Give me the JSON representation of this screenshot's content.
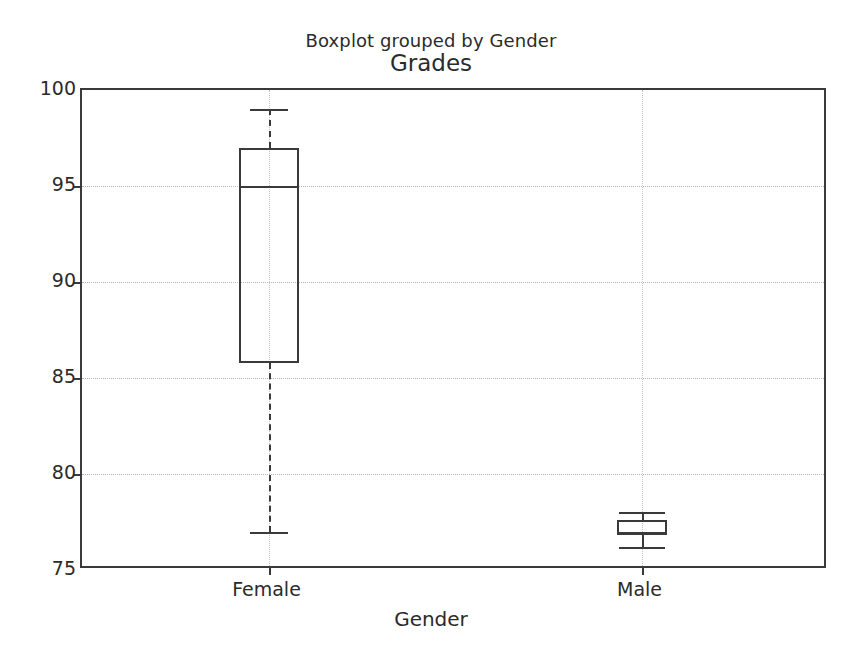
{
  "figure": {
    "suptitle": "Boxplot grouped by Gender",
    "axes_title": "Grades",
    "xlabel": "Gender",
    "ylabel": ""
  },
  "chart_data": {
    "type": "box",
    "title": "Grades",
    "suptitle": "Boxplot grouped by Gender",
    "xlabel": "Gender",
    "ylabel": "",
    "categories": [
      "Female",
      "Male"
    ],
    "xtick_labels": [
      "Female",
      "Male"
    ],
    "ytick_labels": [
      "75",
      "80",
      "85",
      "90",
      "95",
      "100"
    ],
    "yticks": [
      75,
      80,
      85,
      90,
      95,
      100
    ],
    "ylim": [
      75,
      100
    ],
    "grid": true,
    "grid_style": "dotted",
    "legend": false,
    "series": [
      {
        "name": "Female",
        "whisker_low": 77.0,
        "q1": 85.8,
        "median": 95.0,
        "q3": 97.0,
        "whisker_high": 99.0,
        "outliers": []
      },
      {
        "name": "Male",
        "whisker_low": 76.2,
        "q1": 76.8,
        "median": 77.0,
        "q3": 77.6,
        "whisker_high": 78.0,
        "outliers": []
      }
    ],
    "colors": {
      "line": "#3a3a3a",
      "grid": "#b8b8b8",
      "background": "#ffffff",
      "text": "#2b2b2b"
    }
  }
}
